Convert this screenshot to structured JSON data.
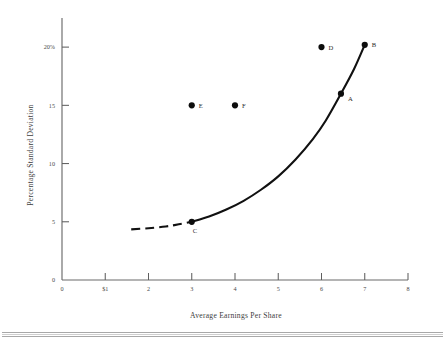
{
  "chart_data": {
    "type": "scatter",
    "title": "",
    "xlabel": "Average Earnings Per Share",
    "ylabel": "Percentage Standard Deviation",
    "xlim": [
      0,
      8
    ],
    "ylim": [
      0,
      22.5
    ],
    "grid": false,
    "legend": null,
    "x_ticks": [
      {
        "value": 0,
        "label": "0"
      },
      {
        "value": 1,
        "label": "$1"
      },
      {
        "value": 2,
        "label": "2"
      },
      {
        "value": 3,
        "label": "3"
      },
      {
        "value": 4,
        "label": "4"
      },
      {
        "value": 5,
        "label": "5"
      },
      {
        "value": 6,
        "label": "6"
      },
      {
        "value": 7,
        "label": "7"
      },
      {
        "value": 8,
        "label": "8"
      }
    ],
    "y_ticks": [
      {
        "value": 0,
        "label": "0"
      },
      {
        "value": 5,
        "label": "5"
      },
      {
        "value": 10,
        "label": "10"
      },
      {
        "value": 15,
        "label": "15"
      },
      {
        "value": 20,
        "label": "20%"
      }
    ],
    "points": [
      {
        "label": "A",
        "x": 6.45,
        "y": 16.0,
        "on_curve": true,
        "label_dx": 7,
        "label_dy": 7
      },
      {
        "label": "B",
        "x": 7.0,
        "y": 20.2,
        "on_curve": true,
        "label_dx": 7,
        "label_dy": 2
      },
      {
        "label": "C",
        "x": 3.0,
        "y": 5.0,
        "on_curve": true,
        "label_dx": 1,
        "label_dy": 11
      },
      {
        "label": "D",
        "x": 6.0,
        "y": 20.0,
        "on_curve": false,
        "label_dx": 7,
        "label_dy": 3
      },
      {
        "label": "E",
        "x": 3.0,
        "y": 15.0,
        "on_curve": false,
        "label_dx": 7,
        "label_dy": 3
      },
      {
        "label": "F",
        "x": 4.0,
        "y": 15.0,
        "on_curve": false,
        "label_dx": 7,
        "label_dy": 3
      }
    ],
    "curve_solid": [
      {
        "x": 3.0,
        "y": 5.0
      },
      {
        "x": 3.4,
        "y": 5.45
      },
      {
        "x": 3.8,
        "y": 6.05
      },
      {
        "x": 4.2,
        "y": 6.8
      },
      {
        "x": 4.6,
        "y": 7.75
      },
      {
        "x": 5.0,
        "y": 8.9
      },
      {
        "x": 5.4,
        "y": 10.35
      },
      {
        "x": 5.8,
        "y": 12.1
      },
      {
        "x": 6.1,
        "y": 13.7
      },
      {
        "x": 6.45,
        "y": 16.0
      },
      {
        "x": 6.75,
        "y": 18.1
      },
      {
        "x": 7.0,
        "y": 20.2
      }
    ],
    "curve_dashed": [
      {
        "x": 1.6,
        "y": 4.35
      },
      {
        "x": 2.0,
        "y": 4.45
      },
      {
        "x": 2.4,
        "y": 4.6
      },
      {
        "x": 2.7,
        "y": 4.78
      },
      {
        "x": 3.0,
        "y": 5.0
      }
    ]
  }
}
